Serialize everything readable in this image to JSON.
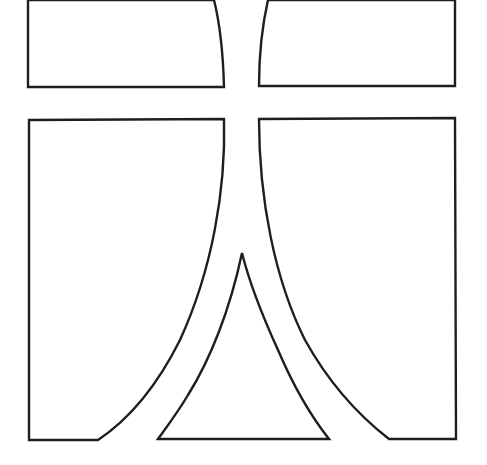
{
  "diagram": {
    "background": "#ffffff",
    "stroke_color": "#1e1e1e",
    "pieces": [
      {
        "id": "top-left",
        "shape": "quadrilateral with curved right edge"
      },
      {
        "id": "top-right",
        "shape": "quadrilateral with curved left edge"
      },
      {
        "id": "bottom-left",
        "shape": "panel with concave flared right edge"
      },
      {
        "id": "bottom-right",
        "shape": "panel with concave flared left edge"
      },
      {
        "id": "bottom-center",
        "shape": "curved-sided triangle (spire)"
      }
    ]
  }
}
